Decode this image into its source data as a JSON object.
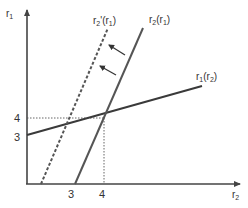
{
  "axes": {
    "y_label": "r",
    "y_label_sub": "1",
    "x_label": "r",
    "x_label_sub": "2"
  },
  "ticks": {
    "y": [
      {
        "label": "4",
        "value": 4
      },
      {
        "label": "3",
        "value": 3
      }
    ],
    "x": [
      {
        "label": "3",
        "value": 3
      },
      {
        "label": "4",
        "value": 4
      }
    ]
  },
  "curves": {
    "r2_of_r1": {
      "label": "r",
      "sub": "2",
      "arg": "(r",
      "arg_sub": "1",
      "close": ")",
      "style": "solid"
    },
    "r2_prime_of_r1": {
      "label": "r",
      "sub": "2",
      "prime": "'",
      "arg": "(r",
      "arg_sub": "1",
      "close": ")",
      "style": "dashed"
    },
    "r1_of_r2": {
      "label": "r",
      "sub": "1",
      "arg": "(r",
      "arg_sub": "2",
      "close": ")",
      "style": "solid"
    }
  },
  "equilibrium": {
    "r1": 4,
    "r2": 4
  },
  "shift_direction": "left",
  "colors": {
    "line": "#3a3a3a",
    "axis": "#444444",
    "text": "#333333"
  }
}
